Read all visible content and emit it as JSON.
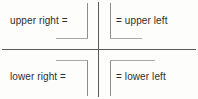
{
  "diagram": {
    "width": 198,
    "height": 99,
    "colors": {
      "background": "#fdfdfc",
      "axis": "#5a5a58",
      "bracket": "#8c8c8a",
      "bracket_light": "#a9a9a6",
      "text": "#2e2e2c"
    },
    "axes": {
      "vertical_label": "vertical-divider",
      "horizontal_label": "horizontal-divider"
    },
    "quadrants": [
      {
        "position": "upper-left",
        "label": "upper right =",
        "bracket": "corner-bracket-opening-left-bottom-foot"
      },
      {
        "position": "upper-right",
        "label": "= upper left",
        "bracket": "corner-bracket-opening-right-bottom-foot"
      },
      {
        "position": "lower-left",
        "label": "lower right =",
        "bracket": "corner-bracket-opening-left-top-shoulder"
      },
      {
        "position": "lower-right",
        "label": "= lower left",
        "bracket": "corner-bracket-opening-right-top-shoulder"
      }
    ]
  }
}
